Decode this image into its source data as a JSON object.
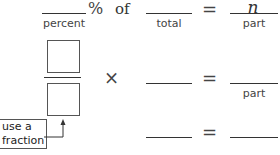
{
  "row1": {
    "percent_label": "percent",
    "percent_symbol": "%",
    "of_word": "of",
    "total_label": "total",
    "equals": "=",
    "answer_value": "n",
    "part_label": "part"
  },
  "row2": {
    "times_symbol": "×",
    "equals": "=",
    "part_label": "part"
  },
  "row3": {
    "equals": "="
  },
  "hint": {
    "line1": "use a",
    "line2": "fraction"
  }
}
